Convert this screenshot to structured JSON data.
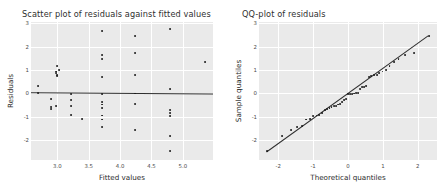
{
  "figure": {
    "width": 448,
    "height": 194,
    "background": "#ffffff",
    "axes_facecolor": "#eaeaea",
    "grid_color": "#ffffff",
    "point_color": "#1a1a1a",
    "line_color": "#2f2f2f"
  },
  "chart_data": [
    {
      "type": "scatter",
      "title": "Scatter plot of residuals against fitted values",
      "xlabel": "Fitted values",
      "ylabel": "Residuals",
      "xlim": [
        2.58,
        5.48
      ],
      "ylim": [
        -2.85,
        3.05
      ],
      "xticks": [
        3.0,
        3.5,
        4.0,
        4.5,
        5.0
      ],
      "xticklabels": [
        "3.0",
        "3.5",
        "4.0",
        "4.5",
        "5.0"
      ],
      "yticks": [
        -2,
        -1,
        0,
        1,
        2,
        3
      ],
      "yticklabels": [
        "-2",
        "-1",
        "0",
        "1",
        "2",
        "3"
      ],
      "grid": true,
      "legend": "none",
      "reference_line": {
        "type": "linear-fit",
        "x": [
          2.58,
          5.48
        ],
        "y": [
          0.03,
          -0.02
        ]
      },
      "x": [
        2.69,
        2.69,
        2.9,
        2.9,
        2.9,
        2.98,
        2.98,
        2.98,
        3.0,
        3.0,
        3.0,
        3.03,
        3.22,
        3.22,
        3.22,
        3.22,
        3.4,
        3.71,
        3.71,
        3.71,
        3.71,
        3.71,
        3.71,
        3.71,
        3.71,
        3.71,
        3.71,
        3.71,
        4.24,
        4.24,
        4.24,
        4.24,
        4.24,
        4.24,
        4.79,
        4.79,
        4.79,
        4.79,
        4.79,
        4.79,
        4.79,
        5.35
      ],
      "y": [
        0.3,
        0.02,
        -0.25,
        -0.6,
        -0.68,
        0.88,
        0.93,
        -0.54,
        1.15,
        0.8,
        0.72,
        0.98,
        -0.03,
        -0.27,
        -0.55,
        -0.92,
        -1.1,
        2.67,
        1.62,
        1.46,
        0.7,
        -0.02,
        -0.38,
        -0.48,
        -0.62,
        -0.95,
        -1.12,
        -1.43,
        2.44,
        1.72,
        0.79,
        -0.01,
        -0.45,
        -1.56,
        2.75,
        0.2,
        -0.72,
        -0.85,
        -0.98,
        -1.83,
        -2.48,
        1.33
      ]
    },
    {
      "type": "scatter",
      "title": "QQ-plot of residuals",
      "xlabel": "Theoretical quantiles",
      "ylabel": "Sample quantiles",
      "xlim": [
        -2.55,
        2.55
      ],
      "ylim": [
        -2.85,
        3.05
      ],
      "xticks": [
        -2,
        -1,
        0,
        1,
        2
      ],
      "xticklabels": [
        "-2",
        "-1",
        "0",
        "1",
        "2"
      ],
      "yticks": [
        -2,
        -1,
        0,
        1,
        2,
        3
      ],
      "yticklabels": [
        "-2",
        "-1",
        "0",
        "1",
        "2",
        "3"
      ],
      "grid": true,
      "legend": "none",
      "reference_line": {
        "type": "qq-reference",
        "x": [
          -2.32,
          2.32
        ],
        "y": [
          -2.5,
          2.48
        ]
      },
      "x": [
        -2.32,
        -1.88,
        -1.63,
        -1.45,
        -1.31,
        -1.19,
        -1.08,
        -0.99,
        -0.9,
        -0.82,
        -0.74,
        -0.67,
        -0.6,
        -0.53,
        -0.47,
        -0.41,
        -0.35,
        -0.29,
        -0.23,
        -0.17,
        -0.11,
        -0.06,
        0.0,
        0.06,
        0.11,
        0.17,
        0.23,
        0.29,
        0.35,
        0.41,
        0.47,
        0.53,
        0.6,
        0.67,
        0.74,
        0.82,
        0.9,
        0.99,
        1.08,
        1.19,
        1.31,
        1.45,
        1.63,
        1.88,
        2.32
      ],
      "y": [
        -2.48,
        -1.83,
        -1.56,
        -1.43,
        -1.4,
        -1.12,
        -1.1,
        -0.98,
        -0.95,
        -0.92,
        -0.85,
        -0.72,
        -0.68,
        -0.62,
        -0.6,
        -0.55,
        -0.54,
        -0.48,
        -0.45,
        -0.38,
        -0.27,
        -0.25,
        -0.03,
        -0.02,
        -0.02,
        -0.01,
        0.0,
        0.02,
        0.2,
        0.25,
        0.28,
        0.3,
        0.7,
        0.72,
        0.79,
        0.8,
        0.88,
        0.93,
        0.98,
        1.15,
        1.33,
        1.46,
        1.62,
        1.72,
        2.44,
        2.67,
        2.75
      ]
    }
  ]
}
